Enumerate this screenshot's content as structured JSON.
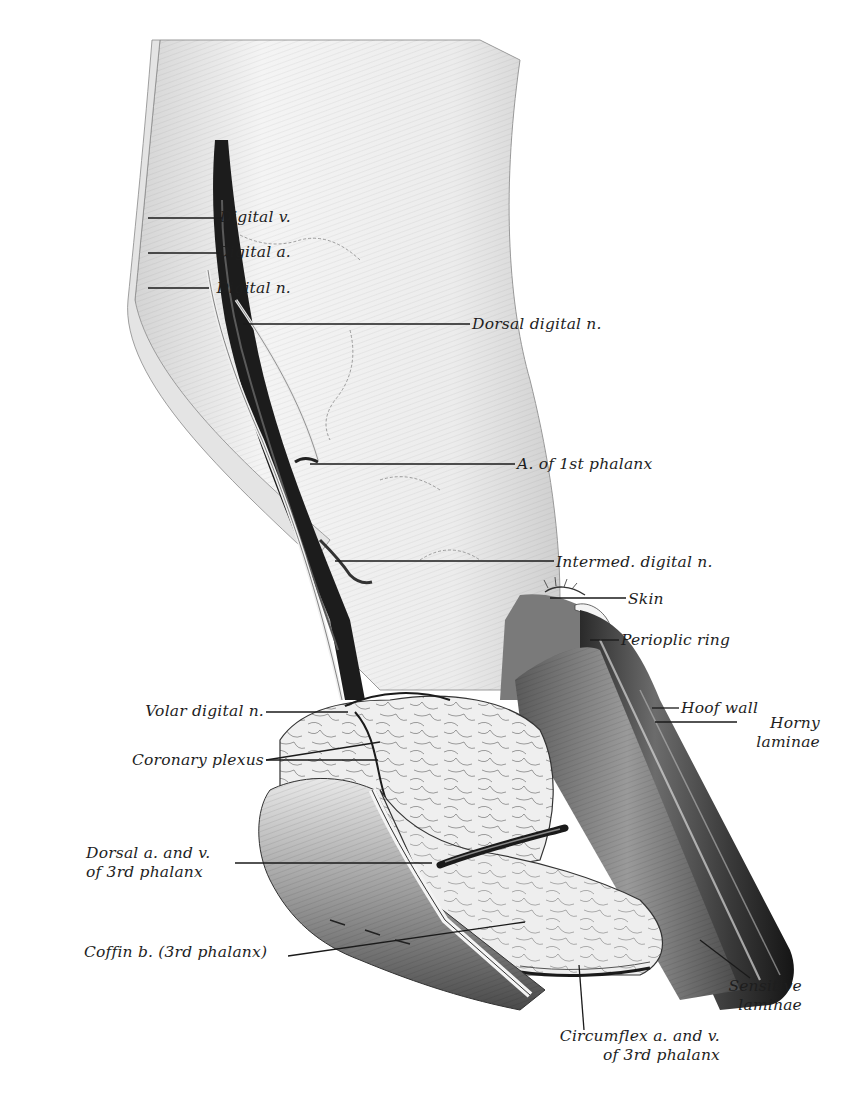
{
  "figure": {
    "colors": {
      "ink": "#1e1e1e",
      "background": "#ffffff",
      "leader": "#1a1a1a"
    }
  },
  "labels": [
    {
      "id": "digital-v",
      "text": "Digital v.",
      "x": 143,
      "y": 208,
      "align": "right",
      "width": 148,
      "line": [
        [
          148,
          218
        ],
        [
          222,
          218
        ]
      ]
    },
    {
      "id": "digital-a",
      "text": "Digital a.",
      "x": 143,
      "y": 243,
      "align": "right",
      "width": 148,
      "line": [
        [
          148,
          253
        ],
        [
          221,
          253
        ]
      ]
    },
    {
      "id": "digital-n",
      "text": "Digital n.",
      "x": 143,
      "y": 279,
      "align": "right",
      "width": 148,
      "line": [
        [
          148,
          288
        ],
        [
          209,
          288
        ]
      ]
    },
    {
      "id": "dorsal-digital-n",
      "text": "Dorsal digital n.",
      "x": 472,
      "y": 315,
      "align": "left",
      "width": 200,
      "line": [
        [
          243,
          324
        ],
        [
          470,
          324
        ]
      ]
    },
    {
      "id": "a-1st-phalanx",
      "text": "A. of 1st phalanx",
      "x": 517,
      "y": 455,
      "align": "left",
      "width": 200,
      "line": [
        [
          310,
          464
        ],
        [
          515,
          464
        ]
      ]
    },
    {
      "id": "intermed-digital-n",
      "text": "Intermed. digital n.",
      "x": 556,
      "y": 553,
      "align": "left",
      "width": 220,
      "line": [
        [
          335,
          561
        ],
        [
          554,
          561
        ]
      ]
    },
    {
      "id": "skin",
      "text": "Skin",
      "x": 628,
      "y": 590,
      "align": "left",
      "width": 60,
      "line": [
        [
          550,
          598
        ],
        [
          626,
          598
        ]
      ]
    },
    {
      "id": "perioplic-ring",
      "text": "Perioplic ring",
      "x": 621,
      "y": 631,
      "align": "left",
      "width": 160,
      "line": [
        [
          590,
          640
        ],
        [
          619,
          640
        ]
      ]
    },
    {
      "id": "hoof-wall",
      "text": "Hoof wall",
      "x": 681,
      "y": 699,
      "align": "left",
      "width": 120,
      "line": [
        [
          652,
          708
        ],
        [
          679,
          708
        ]
      ]
    },
    {
      "id": "horny-laminae",
      "text": "Horny\nlaminae",
      "x": 730,
      "y": 714,
      "align": "right",
      "width": 90,
      "line": [
        [
          655,
          722
        ],
        [
          737,
          722
        ]
      ]
    },
    {
      "id": "volar-digital-n",
      "text": "Volar digital n.",
      "x": 108,
      "y": 702,
      "align": "right",
      "width": 156,
      "line": [
        [
          266,
          712
        ],
        [
          348,
          712
        ]
      ]
    },
    {
      "id": "coronary-plexus",
      "text": "Coronary plexus",
      "x": 108,
      "y": 751,
      "align": "right",
      "width": 156,
      "line": [
        [
          266,
          760
        ],
        [
          380,
          742
        ],
        [
          266,
          760
        ],
        [
          378,
          760
        ]
      ]
    },
    {
      "id": "dorsal-av-3rd",
      "text": "Dorsal a. and v.\nof 3rd phalanx",
      "x": 86,
      "y": 844,
      "align": "left",
      "width": 160,
      "line": [
        [
          235,
          863
        ],
        [
          432,
          863
        ]
      ]
    },
    {
      "id": "coffin-b",
      "text": "Coffin b. (3rd phalanx)",
      "x": 84,
      "y": 943,
      "align": "left",
      "width": 210,
      "line": [
        [
          288,
          956
        ],
        [
          525,
          922
        ]
      ]
    },
    {
      "id": "sensitive-laminae",
      "text": "Sensitive\nlaminae",
      "x": 716,
      "y": 977,
      "align": "right",
      "width": 86,
      "line": [
        [
          700,
          940
        ],
        [
          750,
          978
        ]
      ]
    },
    {
      "id": "circumflex-av-3rd",
      "text": "Circumflex a. and v.\nof 3rd phalanx",
      "x": 544,
      "y": 1027,
      "align": "right",
      "width": 176,
      "line": [
        [
          579,
          965
        ],
        [
          584,
          1030
        ]
      ]
    }
  ]
}
